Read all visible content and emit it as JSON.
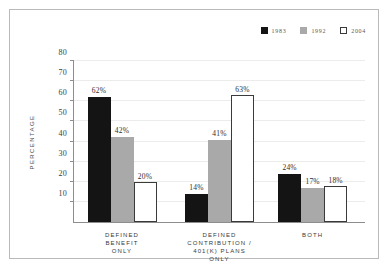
{
  "chart_data": {
    "type": "bar",
    "title": "",
    "xlabel": "",
    "ylabel": "PERCENTAGE",
    "ylim": [
      0,
      80
    ],
    "yticks": [
      10,
      20,
      30,
      40,
      50,
      60,
      70,
      80
    ],
    "grid": true,
    "legend_position": "top-right",
    "categories": [
      "DEFINED\nBENEFIT\nONLY",
      "DEFINED\nCONTRIBUTION /\n401(K) PLANS\nONLY",
      "BOTH"
    ],
    "category_lines": [
      [
        "DEFINED",
        "BENEFIT",
        "ONLY"
      ],
      [
        "DEFINED",
        "CONTRIBUTION /",
        "401(K) PLANS",
        "ONLY"
      ],
      [
        "BOTH"
      ]
    ],
    "series": [
      {
        "name": "1983",
        "color": "#141414",
        "values": [
          62,
          14,
          24
        ],
        "labels": [
          "62%",
          "14%",
          "24%"
        ]
      },
      {
        "name": "1992",
        "color": "#a9a9a9",
        "values": [
          42,
          41,
          17
        ],
        "labels": [
          "42%",
          "41%",
          "17%"
        ]
      },
      {
        "name": "2004",
        "color": "#ffffff",
        "values": [
          20,
          63,
          18
        ],
        "labels": [
          "20%",
          "63%",
          "18%"
        ]
      }
    ]
  },
  "axis": {
    "tick_labels": [
      "80",
      "70",
      "60",
      "50",
      "40",
      "30",
      "20",
      "10"
    ]
  },
  "legend": {
    "items": [
      {
        "label": "1983",
        "swatch": "black-square-icon"
      },
      {
        "label": "1992",
        "swatch": "gray-square-icon"
      },
      {
        "label": "2004",
        "swatch": "white-square-icon"
      }
    ]
  },
  "colors": {
    "series_1983": "#141414",
    "series_1992": "#a9a9a9",
    "series_2004": "#ffffff",
    "axis": "#8d8d8d",
    "grid": "#ececec",
    "frame": "#b9b9b9",
    "text": "#35393c"
  }
}
